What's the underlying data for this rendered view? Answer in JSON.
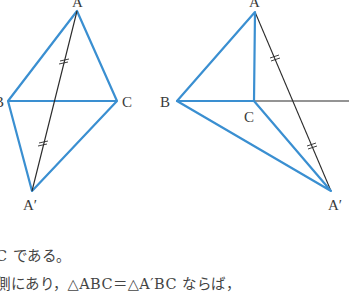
{
  "figures": {
    "left": {
      "labels": {
        "A": "A",
        "B": "B",
        "C": "C",
        "A_prime": "A′"
      }
    },
    "right": {
      "labels": {
        "A": "A",
        "B": "B",
        "C": "C",
        "A_prime": "A′"
      }
    },
    "colors": {
      "triangle": "#3a8fd1",
      "segment": "#2b2b2b"
    }
  },
  "text": {
    "line1": "C である。",
    "line2": "側にあり，△ABC＝△A′BC ならば，"
  }
}
